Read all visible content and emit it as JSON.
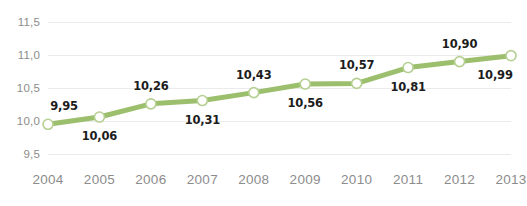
{
  "chart_data": {
    "type": "line",
    "title": "",
    "subtitle": "",
    "xlabel": "",
    "ylabel": "",
    "categories": [
      "2004",
      "2005",
      "2006",
      "2007",
      "2008",
      "2009",
      "2010",
      "2011",
      "2012",
      "2013"
    ],
    "values": [
      9.95,
      10.06,
      10.26,
      10.31,
      10.43,
      10.56,
      10.57,
      10.81,
      10.9,
      10.99
    ],
    "value_labels": [
      "9,95",
      "10,06",
      "10,26",
      "10,31",
      "10,43",
      "10,56",
      "10,57",
      "10,81",
      "10,90",
      "10,99"
    ],
    "label_positions": [
      "above",
      "below",
      "above",
      "below",
      "above",
      "below",
      "above",
      "below",
      "above",
      "below"
    ],
    "ylim": [
      9.5,
      11.5
    ],
    "yticks": [
      9.5,
      10.0,
      10.5,
      11.0,
      11.5
    ],
    "ytick_labels": [
      "9,5",
      "10,0",
      "10,5",
      "11,0",
      "11,5"
    ],
    "grid": true,
    "legend": "none",
    "decimal_separator": ",",
    "series": [
      {
        "name": "",
        "values": [
          9.95,
          10.06,
          10.26,
          10.31,
          10.43,
          10.56,
          10.57,
          10.81,
          10.9,
          10.99
        ]
      }
    ],
    "colors": {
      "line": "#9CBF6E",
      "marker_fill": "#FFFFFF",
      "marker_stroke": "#B6CF92",
      "gridline": "#EBEBEB",
      "axis_text": "#8C8C8C",
      "label_text": "#1C1C1C",
      "background": "#FFFFFF"
    }
  }
}
